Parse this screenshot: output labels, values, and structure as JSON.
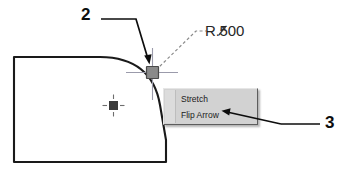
{
  "figure": {
    "background_color": "#ffffff",
    "width": 348,
    "height": 171
  },
  "drawing": {
    "description": "CAD part outline with rounded top-right corner fillet",
    "outline_color": "#1a1a1a",
    "shape_name": "rounded-corner-rectangle"
  },
  "dimension": {
    "radius_label": "R.500",
    "leader_style": "dashed",
    "leader_color": "#808080"
  },
  "grip": {
    "name": "fillet-radius-grip",
    "fill_color": "#808080",
    "border_color": "#4d4d4d",
    "crosshair_color": "#9999a8"
  },
  "center_mark": {
    "name": "arc-center-point",
    "fill_color": "#3b3b3b"
  },
  "context_menu": {
    "background_color": "#d2d2d2",
    "gutter_color": "#dcdcdc",
    "text_color": "#1a1a1a",
    "items": [
      {
        "label": "Stretch"
      },
      {
        "label": "Flip Arrow"
      }
    ]
  },
  "callouts": [
    {
      "number": "2",
      "target": "fillet-radius-grip"
    },
    {
      "number": "3",
      "target": "flip-arrow-menu-item"
    }
  ]
}
